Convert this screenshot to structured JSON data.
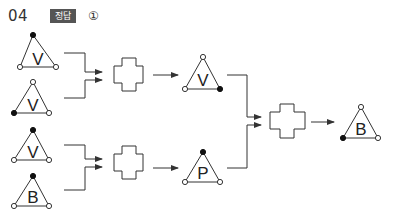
{
  "header": {
    "question_number": "04",
    "badge_label": "정답",
    "answer": "①"
  },
  "colors": {
    "line": "#333333",
    "badge_bg": "#555555",
    "text": "#222222"
  },
  "diagram": {
    "inputs": [
      {
        "letter": "V",
        "apex": "filled",
        "left": "open",
        "right": "open"
      },
      {
        "letter": "V",
        "apex": "open",
        "left": "filled",
        "right": "open"
      },
      {
        "letter": "V",
        "apex": "filled",
        "left": "open",
        "right": "open"
      },
      {
        "letter": "B",
        "apex": "filled",
        "left": "open",
        "right": "open"
      }
    ],
    "intermediate": [
      {
        "letter": "V",
        "apex": "open",
        "left": "open",
        "right": "filled"
      },
      {
        "letter": "P",
        "apex": "filled",
        "left": "open",
        "right": "open"
      }
    ],
    "output": {
      "letter": "B",
      "apex": "open",
      "left": "filled",
      "right": "open"
    },
    "operator_shape": "cross"
  }
}
